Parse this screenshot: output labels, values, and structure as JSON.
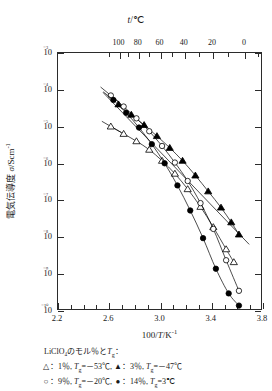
{
  "chart_data": {
    "type": "scatter",
    "title": "",
    "xlabel": "100/T/K⁻¹",
    "ylabel": "電気伝導度 σ/Scm⁻¹",
    "top_axis_label": "t/℃",
    "xlim": [
      2.2,
      3.8
    ],
    "ylim_log": [
      -10,
      -3
    ],
    "grid": false,
    "legend_position": "below-plot",
    "x_ticks": [
      2.2,
      2.3,
      2.4,
      2.5,
      2.6,
      2.7,
      2.8,
      2.9,
      3.0,
      3.1,
      3.2,
      3.3,
      3.4,
      3.5,
      3.6,
      3.7,
      3.8
    ],
    "x_tick_labels": [
      "2.2",
      "2.6",
      "3.0",
      "3.4",
      "3.8"
    ],
    "x_tick_label_values": [
      2.2,
      2.6,
      3.0,
      3.4,
      3.8
    ],
    "y_tick_exponents": [
      -3,
      -4,
      -5,
      -6,
      -7,
      -8,
      -9,
      -10
    ],
    "y_tick_labels": [
      "10⁻³",
      "10⁻⁴",
      "10⁻⁵",
      "10⁻⁶",
      "10⁻⁷",
      "10⁻⁸",
      "10⁻⁹",
      "10⁻¹⁰"
    ],
    "top_ticks_celsius": [
      100,
      80,
      60,
      40,
      20,
      0
    ],
    "top_ticks_x": [
      2.68,
      2.83,
      3.0,
      3.19,
      3.41,
      3.66
    ],
    "top_minor_ticks_x": [
      2.6,
      2.75,
      2.91,
      3.09,
      3.3,
      3.53,
      3.76
    ],
    "series": [
      {
        "name": "1%",
        "label": "1%, Tg = -53℃",
        "marker": "open-triangle",
        "color": "#000000",
        "points": [
          [
            2.62,
            -5.02
          ],
          [
            2.72,
            -5.22
          ],
          [
            2.82,
            -5.42
          ],
          [
            2.92,
            -5.65
          ],
          [
            3.02,
            -5.95
          ],
          [
            3.12,
            -6.3
          ],
          [
            3.22,
            -6.72
          ],
          [
            3.32,
            -7.2
          ],
          [
            3.42,
            -7.75
          ],
          [
            3.52,
            -8.35
          ],
          [
            3.58,
            -8.7
          ]
        ],
        "fit_line": [
          [
            2.55,
            -4.88
          ],
          [
            2.7,
            -5.18
          ]
        ]
      },
      {
        "name": "3%",
        "label": "3%, Tg = -47℃",
        "marker": "filled-triangle",
        "color": "#000000",
        "points": [
          [
            2.68,
            -4.42
          ],
          [
            2.78,
            -4.7
          ],
          [
            2.88,
            -4.98
          ],
          [
            2.98,
            -5.28
          ],
          [
            3.08,
            -5.6
          ],
          [
            3.18,
            -5.95
          ],
          [
            3.28,
            -6.35
          ],
          [
            3.38,
            -6.78
          ],
          [
            3.48,
            -7.22
          ],
          [
            3.56,
            -7.62
          ],
          [
            3.62,
            -7.95
          ]
        ],
        "fit_line": [
          [
            2.56,
            -4.1
          ],
          [
            3.7,
            -8.22
          ]
        ]
      },
      {
        "name": "9%",
        "label": "9%, Tg = -20℃",
        "marker": "open-circle",
        "color": "#000000",
        "points": [
          [
            2.62,
            -4.18
          ],
          [
            2.72,
            -4.48
          ],
          [
            2.82,
            -4.8
          ],
          [
            2.92,
            -5.15
          ],
          [
            3.02,
            -5.55
          ],
          [
            3.12,
            -6.0
          ],
          [
            3.22,
            -6.5
          ],
          [
            3.32,
            -7.1
          ],
          [
            3.42,
            -7.8
          ],
          [
            3.52,
            -8.65
          ],
          [
            3.62,
            -9.48
          ]
        ],
        "fit_line": [
          [
            2.54,
            -3.95
          ],
          [
            2.68,
            -4.35
          ]
        ]
      },
      {
        "name": "14%",
        "label": "14%, Tg = 3℃",
        "marker": "filled-circle",
        "color": "#000000",
        "points": [
          [
            2.64,
            -4.3
          ],
          [
            2.74,
            -4.65
          ],
          [
            2.84,
            -5.05
          ],
          [
            2.94,
            -5.5
          ],
          [
            3.04,
            -6.02
          ],
          [
            3.14,
            -6.62
          ],
          [
            3.24,
            -7.3
          ],
          [
            3.34,
            -8.05
          ],
          [
            3.44,
            -8.88
          ],
          [
            3.54,
            -9.55
          ],
          [
            3.62,
            -9.88
          ]
        ],
        "fit_line": [
          [
            2.56,
            -4.08
          ],
          [
            2.66,
            -4.35
          ]
        ]
      }
    ]
  },
  "top_axis": {
    "title_symbol": "t",
    "title_unit": "/℃",
    "labels": [
      "100",
      "80",
      "60",
      "40",
      "20",
      "0"
    ]
  },
  "y_axis": {
    "title_jp": "電気伝導度",
    "title_sym": "σ",
    "title_unit": "/Scm",
    "title_exp": "-1"
  },
  "x_axis": {
    "title_pre": "100/",
    "title_sym": "T",
    "title_unit": "/K",
    "title_exp": "-1"
  },
  "legend": {
    "title": "LiClO₄のモル％と",
    "title_sym": "T",
    "title_sub": "g",
    "title_colon": "：",
    "rows": [
      {
        "left_marker": "△",
        "left_text_a": "：1％, ",
        "left_sym": "T",
        "left_sub": "g",
        "left_text_b": "=－53℃, ",
        "right_marker": "▲",
        "right_text_a": "：3％, ",
        "right_sym": "T",
        "right_sub": "g",
        "right_text_b": "=－47℃"
      },
      {
        "left_marker": "○",
        "left_text_a": "：9％, ",
        "left_sym": "T",
        "left_sub": "g",
        "left_text_b": "=－20℃, ",
        "right_marker": "●",
        "right_text_a": "：14％, ",
        "right_sym": "T",
        "right_sub": "g",
        "right_text_b": "=3℃"
      }
    ]
  }
}
